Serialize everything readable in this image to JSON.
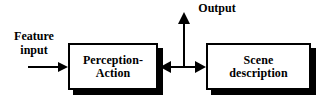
{
  "diagram": {
    "background_color": "#ffffff",
    "line_color": "#000000",
    "box_fill_color": "#ffffff",
    "shadow_color": "#000000",
    "nodes": [
      {
        "id": "perception-action",
        "line1": "Perception-",
        "line2": "Action",
        "shape": "rectangle-with-drop-shadow"
      },
      {
        "id": "scene-description",
        "line1": "Scene",
        "line2": "description",
        "shape": "rectangle-with-drop-shadow"
      }
    ],
    "labels": {
      "feature_input_line1": "Feature",
      "feature_input_line2": "input",
      "output": "Output"
    },
    "connectors": [
      {
        "id": "feature-input-arrow",
        "direction": "right",
        "arrowheads": "single-end",
        "from": "Feature input",
        "to": "perception-action"
      },
      {
        "id": "interconnect-arrow",
        "direction": "horizontal",
        "arrowheads": "double",
        "from": "perception-action",
        "to": "scene-description"
      },
      {
        "id": "output-arrow",
        "direction": "up",
        "arrowheads": "single-end",
        "from": "interconnect-arrow",
        "to": "Output"
      }
    ]
  }
}
